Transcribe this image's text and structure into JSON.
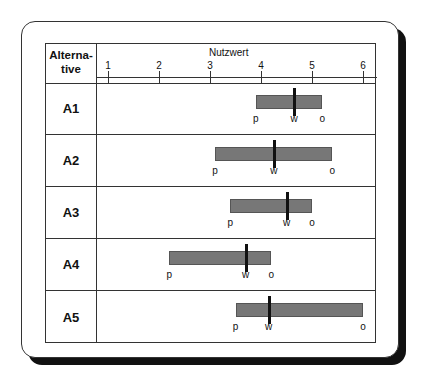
{
  "header": {
    "alternative_label": "Alterna-\ntive",
    "alt_line1": "Alterna-",
    "alt_line2": "tive",
    "axis_title": "Nutzwert"
  },
  "axis": {
    "ticks": [
      "1",
      "2",
      "3",
      "4",
      "5",
      "6"
    ]
  },
  "markers": {
    "p": "p",
    "w": "w",
    "o": "o"
  },
  "rows": [
    {
      "label": "A1"
    },
    {
      "label": "A2"
    },
    {
      "label": "A3"
    },
    {
      "label": "A4"
    },
    {
      "label": "A5"
    }
  ],
  "colors": {
    "bar": "#777777",
    "line": "#111111"
  },
  "chart_data": {
    "type": "range-bar",
    "title": "Nutzwert",
    "xlabel": "Nutzwert",
    "ylabel": "Alternative",
    "xlim": [
      1,
      6
    ],
    "categories": [
      "A1",
      "A2",
      "A3",
      "A4",
      "A5"
    ],
    "series": [
      {
        "name": "p (pessimistisch)",
        "values": [
          3.9,
          3.1,
          3.4,
          2.2,
          3.5
        ]
      },
      {
        "name": "w (wahrscheinlich)",
        "values": [
          4.65,
          4.25,
          4.5,
          3.7,
          4.15
        ]
      },
      {
        "name": "o (optimistisch)",
        "values": [
          5.2,
          5.4,
          5.0,
          4.2,
          6.0
        ]
      }
    ]
  }
}
